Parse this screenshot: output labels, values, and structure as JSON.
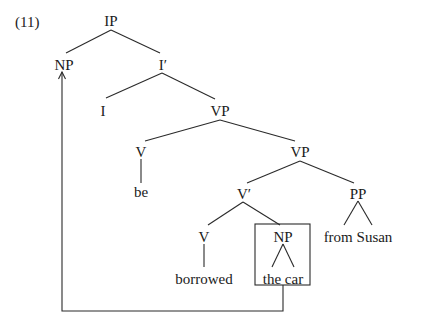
{
  "example_number": "(11)",
  "tree": {
    "nodes": {
      "ip": "IP",
      "np_subject": "NP",
      "i_bar": "I′",
      "i": "I",
      "vp_upper": "VP",
      "v_be": "V",
      "be": "be",
      "vp_lower": "VP",
      "v_bar": "V′",
      "pp": "PP",
      "v_borrowed": "V",
      "np_object": "NP",
      "borrowed": "borrowed",
      "the_car": "the car",
      "from_susan": "from Susan"
    },
    "edges": [
      [
        "IP",
        "NP"
      ],
      [
        "IP",
        "I′"
      ],
      [
        "I′",
        "I"
      ],
      [
        "I′",
        "VP"
      ],
      [
        "VP",
        "V"
      ],
      [
        "VP",
        "VP"
      ],
      [
        "V",
        "be"
      ],
      [
        "VP",
        "V′"
      ],
      [
        "VP",
        "PP"
      ],
      [
        "PP",
        "from Susan"
      ],
      [
        "V′",
        "V"
      ],
      [
        "V′",
        "NP"
      ],
      [
        "V",
        "borrowed"
      ],
      [
        "NP",
        "the car"
      ]
    ],
    "movement": {
      "from": "NP (the car, boxed)",
      "to": "NP (subject of IP)",
      "style": "arrow"
    }
  },
  "colors": {
    "ink": "#1a1a1a",
    "lines": "#2a2a2a",
    "background": "#ffffff"
  }
}
